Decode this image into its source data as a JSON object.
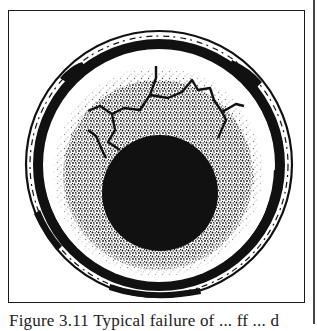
{
  "figure": {
    "colors": {
      "ink": "#111111",
      "paper": "#ffffff",
      "frame": "#1a1a1a"
    },
    "geometry": {
      "outer_circle": {
        "cx": 159,
        "cy": 164,
        "r": 134
      },
      "black_ring": {
        "cx": 159,
        "cy": 165,
        "r_outer": 126,
        "r_inner": 115
      },
      "white_band": {
        "cx": 159,
        "cy": 167,
        "r": 114
      },
      "speckled_zone": {
        "cx": 158,
        "cy": 172,
        "r": 104
      },
      "dark_core": {
        "cx": 160,
        "cy": 193,
        "r": 58
      }
    }
  },
  "caption": {
    "label": "Figure 3.11",
    "text": "Typical failure of ... ff ... d"
  }
}
